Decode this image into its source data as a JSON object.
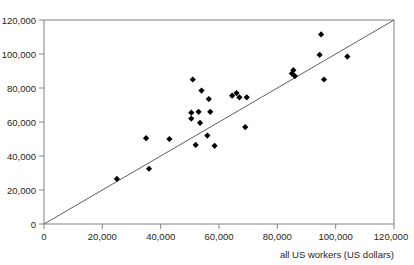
{
  "chart_data": {
    "type": "scatter",
    "title": "",
    "subtitle": "",
    "xlabel": "all US workers (US dollars)",
    "ylabel": "",
    "xlim": [
      0,
      120000
    ],
    "ylim": [
      0,
      120000
    ],
    "xticks": [
      0,
      20000,
      40000,
      60000,
      80000,
      100000,
      120000
    ],
    "yticks": [
      0,
      20000,
      40000,
      60000,
      80000,
      100000,
      120000
    ],
    "xticklabels": [
      "0",
      "20,000",
      "40,000",
      "60,000",
      "80,000",
      "100,000",
      "120,000"
    ],
    "yticklabels": [
      "0",
      "20,000",
      "40,000",
      "60,000",
      "80,000",
      "100,000",
      "120,000"
    ],
    "grid": false,
    "legend": null,
    "marker": "diamond",
    "marker_color": "#000000",
    "reference_line": {
      "name": "y = x identity line",
      "from": [
        0,
        0
      ],
      "to": [
        120000,
        120000
      ],
      "color": "#4d4d4d"
    },
    "points": [
      {
        "x": 25000,
        "y": 26500
      },
      {
        "x": 35000,
        "y": 50500
      },
      {
        "x": 36000,
        "y": 32500
      },
      {
        "x": 43000,
        "y": 50000
      },
      {
        "x": 51000,
        "y": 85000
      },
      {
        "x": 50500,
        "y": 65500
      },
      {
        "x": 50500,
        "y": 62000
      },
      {
        "x": 52000,
        "y": 46500
      },
      {
        "x": 54000,
        "y": 78500
      },
      {
        "x": 53000,
        "y": 66000
      },
      {
        "x": 53500,
        "y": 59500
      },
      {
        "x": 56500,
        "y": 73500
      },
      {
        "x": 57000,
        "y": 66000
      },
      {
        "x": 56000,
        "y": 52000
      },
      {
        "x": 58500,
        "y": 46000
      },
      {
        "x": 64500,
        "y": 75500
      },
      {
        "x": 66000,
        "y": 77000
      },
      {
        "x": 67000,
        "y": 74500
      },
      {
        "x": 69500,
        "y": 74500
      },
      {
        "x": 69000,
        "y": 57000
      },
      {
        "x": 85000,
        "y": 88500
      },
      {
        "x": 85500,
        "y": 90500
      },
      {
        "x": 86000,
        "y": 87000
      },
      {
        "x": 95000,
        "y": 111500
      },
      {
        "x": 94500,
        "y": 99500
      },
      {
        "x": 96000,
        "y": 85000
      },
      {
        "x": 104000,
        "y": 98500
      }
    ]
  },
  "axes": {
    "x_axis_name": "x-axis",
    "y_axis_name": "y-axis"
  }
}
